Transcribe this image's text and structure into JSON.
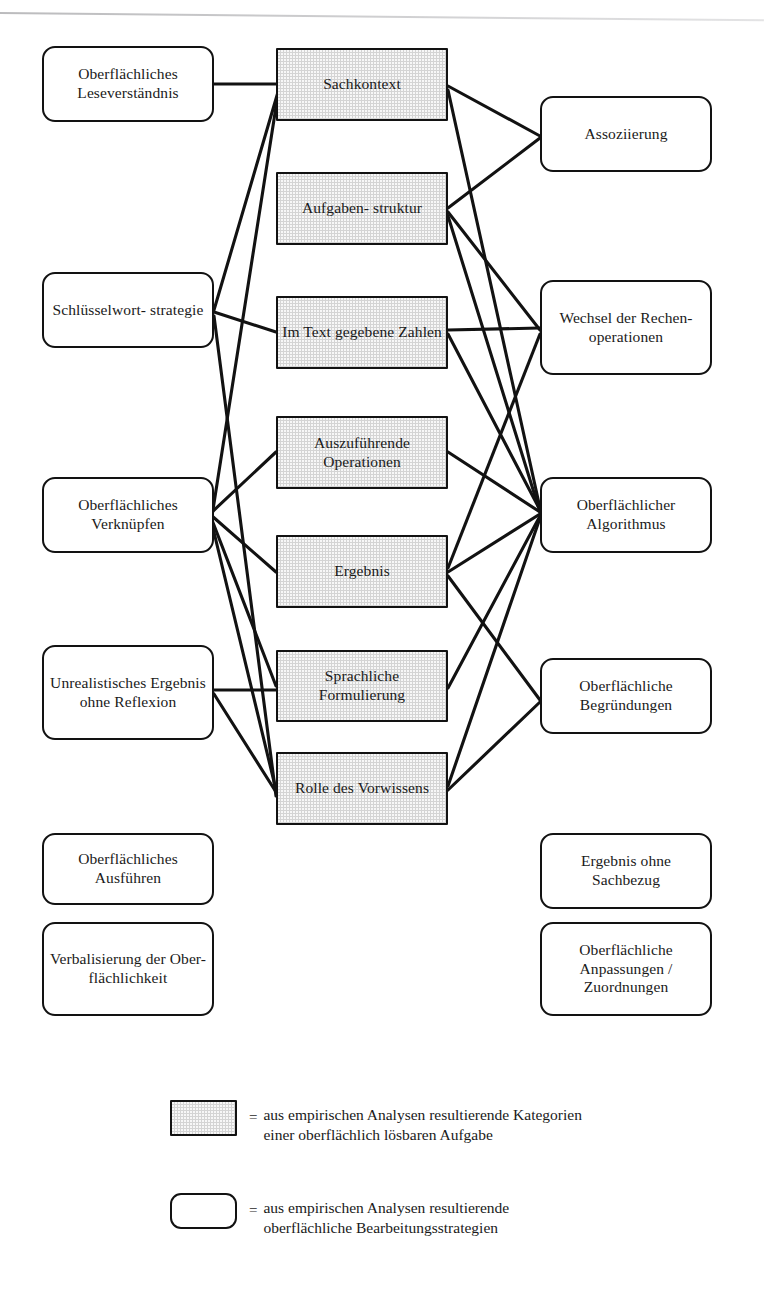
{
  "figure": {
    "type": "concept-relationship-diagram",
    "language": "de",
    "line_color": "#121212",
    "category_fill": "#d4d4d4",
    "strategy_fill": "#ffffff"
  },
  "left_column": {
    "title": "Oberflächliche Bearbeitungsstrategien (links)",
    "items": [
      {
        "id": "leseverstaendnis",
        "label": "Oberflächliches\nLeseverständnis",
        "x": 42,
        "y": 46,
        "w": 172,
        "h": 76
      },
      {
        "id": "schluesselwort",
        "label": "Schlüsselwort-\nstrategie",
        "x": 42,
        "y": 272,
        "w": 172,
        "h": 76
      },
      {
        "id": "verknuepfen",
        "label": "Oberflächliches\nVerknüpfen",
        "x": 42,
        "y": 477,
        "w": 172,
        "h": 76
      },
      {
        "id": "unrealistisch",
        "label": "Unrealistisches\nErgebnis ohne\nReflexion",
        "x": 42,
        "y": 645,
        "w": 172,
        "h": 95
      },
      {
        "id": "ausfuehren",
        "label": "Oberflächliches\nAusführen",
        "x": 42,
        "y": 833,
        "w": 172,
        "h": 72
      },
      {
        "id": "verbalisierung",
        "label": "Verbalisierung\nder Ober-\nflächlichkeit",
        "x": 42,
        "y": 922,
        "w": 172,
        "h": 94
      }
    ]
  },
  "center_column": {
    "title": "Kategorien einer oberflächlich lösbaren Aufgabe (Mitte)",
    "items": [
      {
        "id": "sachkontext",
        "label": "Sachkontext",
        "x": 276,
        "y": 48,
        "w": 172,
        "h": 73
      },
      {
        "id": "aufgabenstruktur",
        "label": "Aufgaben-\nstruktur",
        "x": 276,
        "y": 172,
        "w": 172,
        "h": 73
      },
      {
        "id": "zahlen",
        "label": "Im Text\ngegebene Zahlen",
        "x": 276,
        "y": 296,
        "w": 172,
        "h": 73
      },
      {
        "id": "operationen",
        "label": "Auszuführende\nOperationen",
        "x": 276,
        "y": 416,
        "w": 172,
        "h": 73
      },
      {
        "id": "ergebnis",
        "label": "Ergebnis",
        "x": 276,
        "y": 535,
        "w": 172,
        "h": 73
      },
      {
        "id": "sprachliche",
        "label": "Sprachliche\nFormulierung",
        "x": 276,
        "y": 650,
        "w": 172,
        "h": 72
      },
      {
        "id": "vorwissen",
        "label": "Rolle des\nVorwissens",
        "x": 276,
        "y": 752,
        "w": 172,
        "h": 73
      }
    ]
  },
  "right_column": {
    "title": "Oberflächliche Bearbeitungsstrategien (rechts)",
    "items": [
      {
        "id": "assoziierung",
        "label": "Assoziierung",
        "x": 540,
        "y": 96,
        "w": 172,
        "h": 76
      },
      {
        "id": "wechsel",
        "label": "Wechsel der\nRechen-\noperationen",
        "x": 540,
        "y": 280,
        "w": 172,
        "h": 95
      },
      {
        "id": "algorithmus",
        "label": "Oberflächlicher\nAlgorithmus",
        "x": 540,
        "y": 477,
        "w": 172,
        "h": 76
      },
      {
        "id": "begruendungen",
        "label": "Oberflächliche\nBegründungen",
        "x": 540,
        "y": 658,
        "w": 172,
        "h": 76
      },
      {
        "id": "sachbezug",
        "label": "Ergebnis ohne\nSachbezug",
        "x": 540,
        "y": 833,
        "w": 172,
        "h": 76
      },
      {
        "id": "anpassungen",
        "label": "Oberflächliche\nAnpassungen /\nZuordnungen",
        "x": 540,
        "y": 922,
        "w": 172,
        "h": 94
      }
    ]
  },
  "edges": [
    {
      "from": "leseverstaendnis",
      "to": "sachkontext",
      "points": "214,84 276,84"
    },
    {
      "from": "sachkontext",
      "to": "schluesselwort",
      "points": "278,92 214,310"
    },
    {
      "from": "sachkontext",
      "to": "verknuepfen",
      "points": "278,94 212,516"
    },
    {
      "from": "schluesselwort",
      "to": "zahlen",
      "points": "214,312 276,332"
    },
    {
      "from": "schluesselwort",
      "to": "vorwissen",
      "points": "214,316 276,796"
    },
    {
      "from": "verknuepfen",
      "to": "operationen",
      "points": "212,512 276,452"
    },
    {
      "from": "verknuepfen",
      "to": "ergebnis",
      "points": "212,516 276,572"
    },
    {
      "from": "verknuepfen",
      "to": "sprachliche",
      "points": "212,520 276,686"
    },
    {
      "from": "verknuepfen",
      "to": "vorwissen",
      "points": "212,524 276,790"
    },
    {
      "from": "unrealistisch",
      "to": "sprachliche",
      "points": "214,690 276,690"
    },
    {
      "from": "unrealistisch",
      "to": "vorwissen",
      "points": "214,694 276,792"
    },
    {
      "from": "sachkontext",
      "to": "assoziierung",
      "points": "448,86 540,136"
    },
    {
      "from": "aufgabenstruktur",
      "to": "assoziierung",
      "points": "448,208 540,138"
    },
    {
      "from": "sachkontext",
      "to": "algorithmus",
      "points": "448,90 540,508"
    },
    {
      "from": "aufgabenstruktur",
      "to": "wechsel",
      "points": "448,212 540,330"
    },
    {
      "from": "aufgabenstruktur",
      "to": "algorithmus",
      "points": "448,216 540,512"
    },
    {
      "from": "zahlen",
      "to": "wechsel",
      "points": "448,330 540,328"
    },
    {
      "from": "zahlen",
      "to": "algorithmus",
      "points": "448,334 540,510"
    },
    {
      "from": "operationen",
      "to": "algorithmus",
      "points": "448,452 540,512"
    },
    {
      "from": "ergebnis",
      "to": "wechsel",
      "points": "448,568 540,334"
    },
    {
      "from": "ergebnis",
      "to": "algorithmus",
      "points": "448,572 540,514"
    },
    {
      "from": "ergebnis",
      "to": "begruendungen",
      "points": "448,576 540,700"
    },
    {
      "from": "sprachliche",
      "to": "algorithmus",
      "points": "448,688 540,516"
    },
    {
      "from": "vorwissen",
      "to": "algorithmus",
      "points": "448,786 540,518"
    },
    {
      "from": "vorwissen",
      "to": "begruendungen",
      "points": "448,790 540,702"
    }
  ],
  "legend": {
    "rows": [
      {
        "id": "legend-category",
        "swatch": "category",
        "equals": "=",
        "text": "aus empirischen Analysen resultierende Kategorien\neiner oberflächlich lösbaren Aufgabe"
      },
      {
        "id": "legend-strategy",
        "swatch": "strategy",
        "equals": "=",
        "text": "aus empirischen Analysen resultierende\noberflächliche Bearbeitungsstrategien"
      }
    ]
  }
}
